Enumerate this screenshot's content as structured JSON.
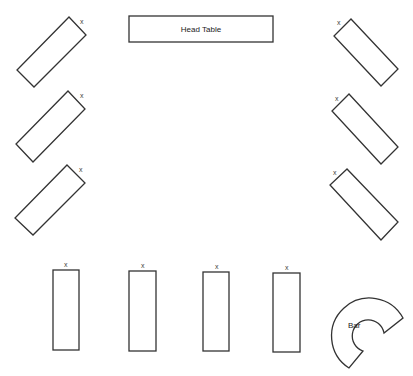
{
  "diagram": {
    "type": "floor-plan",
    "head_table": {
      "label": "Head Table",
      "x": 129,
      "y": 16,
      "w": 144,
      "h": 26
    },
    "seat_marker": "x",
    "left_tables": [
      {
        "points": "69,17 86,35 34,87 17,70",
        "mark": {
          "x": 80,
          "y": 24
        }
      },
      {
        "points": "68,91 85,109 33,162 16,144",
        "mark": {
          "x": 80,
          "y": 98
        }
      },
      {
        "points": "67,165 85,183 33,235 15,218",
        "mark": {
          "x": 79,
          "y": 172
        }
      }
    ],
    "right_tables": [
      {
        "points": "351,19 334,36 381,86 398,69",
        "mark": {
          "x": 339,
          "y": 25
        }
      },
      {
        "points": "349,94 332,111 381,164 398,147",
        "mark": {
          "x": 337,
          "y": 101
        }
      },
      {
        "points": "347,169 330,185 381,240 398,222",
        "mark": {
          "x": 335,
          "y": 175
        }
      }
    ],
    "bottom_tables": [
      {
        "x": 53,
        "y": 270,
        "w": 26,
        "h": 80,
        "mark": {
          "x": 66,
          "y": 267
        }
      },
      {
        "x": 129,
        "y": 271,
        "w": 27,
        "h": 80,
        "mark": {
          "x": 143,
          "y": 268
        }
      },
      {
        "x": 203,
        "y": 272,
        "w": 26,
        "h": 79,
        "mark": {
          "x": 217,
          "y": 269
        }
      },
      {
        "x": 273,
        "y": 273,
        "w": 27,
        "h": 79,
        "mark": {
          "x": 287,
          "y": 270
        }
      }
    ],
    "bar": {
      "label": "Bar"
    }
  }
}
